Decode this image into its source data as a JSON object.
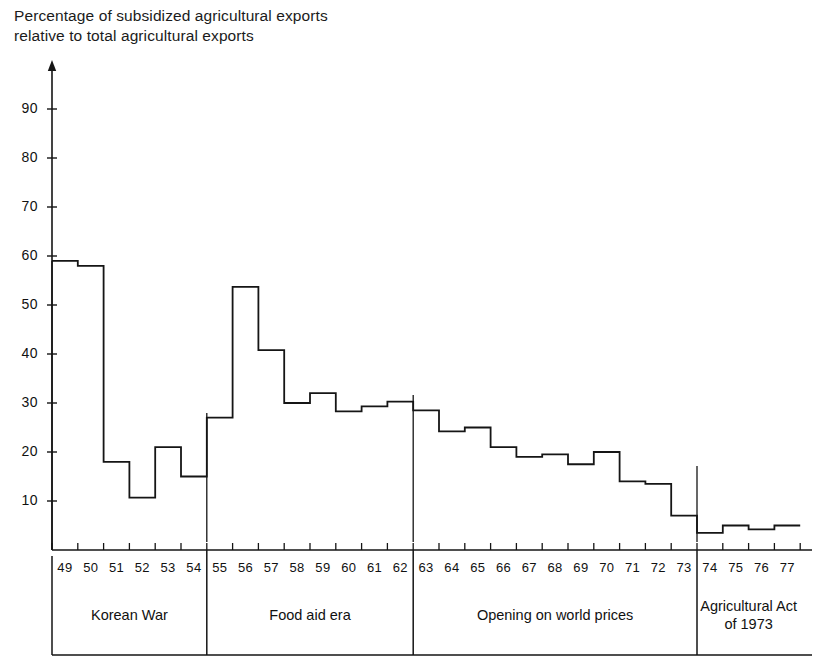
{
  "chart_data": {
    "type": "area",
    "title": "Percentage of subsidized agricultural exports\nrelative to total agricultural exports",
    "xlabel": "",
    "ylabel": "",
    "grid": false,
    "legend": "none",
    "ylim": [
      0,
      98
    ],
    "yticks": [
      10,
      20,
      30,
      40,
      50,
      60,
      70,
      80,
      90
    ],
    "ytick_labels": [
      "10",
      "20",
      "30",
      "40",
      "50",
      "60",
      "70",
      "80",
      "90"
    ],
    "x": [
      "49",
      "50",
      "51",
      "52",
      "53",
      "54",
      "55",
      "56",
      "57",
      "58",
      "59",
      "60",
      "61",
      "62",
      "63",
      "64",
      "65",
      "66",
      "67",
      "68",
      "69",
      "70",
      "71",
      "72",
      "73",
      "74",
      "75",
      "76",
      "77"
    ],
    "categories": [
      "49",
      "50",
      "51",
      "52",
      "53",
      "54",
      "55",
      "56",
      "57",
      "58",
      "59",
      "60",
      "61",
      "62",
      "63",
      "64",
      "65",
      "66",
      "67",
      "68",
      "69",
      "70",
      "71",
      "72",
      "73",
      "74",
      "75",
      "76",
      "77"
    ],
    "values": [
      59,
      58,
      18,
      10.7,
      21,
      15,
      27,
      53.7,
      40.8,
      30,
      32,
      28.3,
      29.3,
      30.3,
      28.5,
      24.2,
      25,
      21,
      19,
      19.5,
      17.5,
      20,
      14,
      13.5,
      7,
      3.5,
      5,
      4.2,
      5
    ],
    "series": [
      {
        "name": "Subsidized share of agricultural exports (%)",
        "values": [
          59,
          58,
          18,
          10.7,
          21,
          15,
          27,
          53.7,
          40.8,
          30,
          32,
          28.3,
          29.3,
          30.3,
          28.5,
          24.2,
          25,
          21,
          19,
          19.5,
          17.5,
          20,
          14,
          13.5,
          7,
          3.5,
          5,
          4.2,
          5
        ]
      }
    ],
    "periods": [
      {
        "label": "Korean War",
        "start": "49",
        "end": "54"
      },
      {
        "label": "Food aid era",
        "start": "55",
        "end": "62"
      },
      {
        "label": "Opening on world prices",
        "start": "63",
        "end": "73"
      },
      {
        "label": "Agricultural Act\nof 1973",
        "start": "74",
        "end": "77"
      }
    ]
  },
  "colors": {
    "line": "#151515",
    "axis": "#151515",
    "text": "#1a1a1a",
    "background": "#ffffff"
  }
}
